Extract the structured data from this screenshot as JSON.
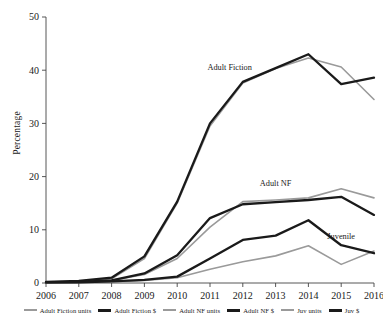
{
  "chart_data": {
    "type": "line",
    "title": "",
    "xlabel": "",
    "ylabel": "Percentage",
    "x": [
      2006,
      2007,
      2008,
      2009,
      2010,
      2011,
      2012,
      2013,
      2014,
      2015,
      2016
    ],
    "xtick_labels": [
      "2006",
      "2007",
      "2008",
      "2009",
      "2010",
      "2011",
      "2012",
      "2013",
      "2014",
      "2015",
      "2016"
    ],
    "ytick_labels": [
      "0",
      "10",
      "20",
      "30",
      "40",
      "50"
    ],
    "yticks": [
      0,
      10,
      20,
      30,
      40,
      50
    ],
    "ylim": [
      0,
      50
    ],
    "xlim": [
      2006,
      2016
    ],
    "grid": false,
    "legend_position": "bottom",
    "series": [
      {
        "name": "Adult Fiction units",
        "color": "#9a9a9a",
        "width": "thin",
        "values": [
          0.2,
          0.3,
          0.8,
          4.6,
          15.0,
          29.5,
          37.6,
          40.3,
          42.3,
          40.6,
          34.5
        ]
      },
      {
        "name": "Adult Fiction $",
        "color": "#1a1a1a",
        "width": "thick",
        "values": [
          0.2,
          0.4,
          1.0,
          5.0,
          15.3,
          30.0,
          37.8,
          40.4,
          43.0,
          37.4,
          38.6
        ]
      },
      {
        "name": "Adult NF units",
        "color": "#9a9a9a",
        "width": "thin",
        "values": [
          0.1,
          0.2,
          0.5,
          1.6,
          4.6,
          10.5,
          15.3,
          15.6,
          16.0,
          17.7,
          16.0
        ]
      },
      {
        "name": "Adult NF $",
        "color": "#1a1a1a",
        "width": "thick",
        "values": [
          0.1,
          0.2,
          0.5,
          1.8,
          5.2,
          12.2,
          14.8,
          15.2,
          15.6,
          16.2,
          12.8
        ]
      },
      {
        "name": "Juv units",
        "color": "#9a9a9a",
        "width": "thin",
        "values": [
          0.1,
          0.1,
          0.2,
          0.5,
          1.0,
          2.6,
          4.0,
          5.1,
          7.0,
          3.5,
          6.0
        ]
      },
      {
        "name": "Juv $",
        "color": "#1a1a1a",
        "width": "thick",
        "values": [
          0.1,
          0.1,
          0.3,
          0.6,
          1.2,
          4.6,
          8.1,
          8.9,
          11.8,
          7.1,
          5.6
        ]
      }
    ],
    "annotations": [
      {
        "text": "Adult Fiction",
        "x": 2011.6,
        "y": 40.0
      },
      {
        "text": "Adult NF",
        "x": 2013.0,
        "y": 18.2
      },
      {
        "text": "Juvenile",
        "x": 2015.0,
        "y": 8.3
      }
    ]
  },
  "legend": {
    "items": [
      {
        "label": "Adult Fiction units",
        "color": "#9a9a9a",
        "width": "thin"
      },
      {
        "label": "Adult Fiction $",
        "color": "#1a1a1a",
        "width": "thick"
      },
      {
        "label": "Adult NF units",
        "color": "#9a9a9a",
        "width": "thin"
      },
      {
        "label": "Adult NF $",
        "color": "#1a1a1a",
        "width": "thick"
      },
      {
        "label": "Juv units",
        "color": "#9a9a9a",
        "width": "thin"
      },
      {
        "label": "Juv $",
        "color": "#1a1a1a",
        "width": "thick"
      }
    ]
  }
}
